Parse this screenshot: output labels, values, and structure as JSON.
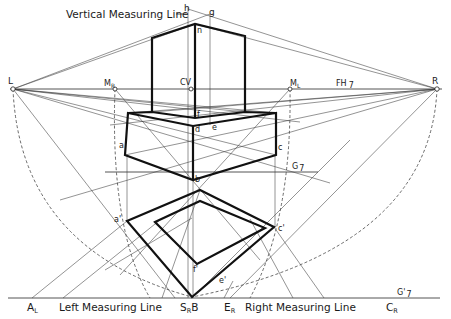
{
  "diagram": {
    "labels": {
      "vertical_measuring_line": "Vertical Measuring Line",
      "h": "h",
      "g": "g",
      "n": "n",
      "L": "L",
      "R": "R",
      "CV": "CV",
      "M_R": "M",
      "M_R_sub": "R",
      "M_L": "M",
      "M_L_sub": "L",
      "FH": "FH",
      "FH_sub": "7",
      "f": "f",
      "e": "e",
      "d": "d",
      "a": "a",
      "c": "c",
      "b": "b",
      "G": "G",
      "G_sub": "7",
      "a_prime": "a'",
      "c_prime": "c'",
      "f_prime": "f'",
      "e_prime": "e'",
      "A_L": "A",
      "A_L_sub": "L",
      "left_measuring_line": "Left Measuring Line",
      "S_R_B": "S",
      "S_R_B_sub": "R",
      "S_R_B_tail": "B",
      "E_R": "E",
      "E_R_sub": "R",
      "right_measuring_line": "Right Measuring Line",
      "C_R": "C",
      "C_R_sub": "R",
      "G_prime": "G'",
      "G_prime_sub": "7"
    },
    "points": {
      "L": [
        13,
        89
      ],
      "R": [
        437,
        89
      ],
      "CV": [
        191,
        89
      ],
      "M_R": [
        115,
        89
      ],
      "M_L": [
        290,
        89
      ],
      "h": [
        188,
        9
      ],
      "g": [
        210,
        14
      ],
      "n": [
        195,
        24
      ],
      "S_R_B": [
        192,
        297
      ],
      "A_L": [
        32,
        298
      ],
      "C_R": [
        324,
        298
      ],
      "E_R": [
        224,
        298
      ]
    },
    "colors": {
      "ink": "#111111",
      "background": "#ffffff"
    }
  }
}
